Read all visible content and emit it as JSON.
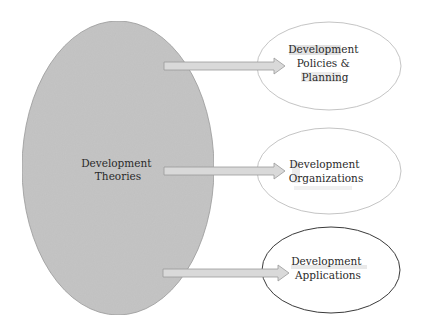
{
  "diagram": {
    "source": {
      "lines": [
        "Development",
        "Theories"
      ],
      "fill": "#c4c4c4",
      "stroke": "#9a9a9a"
    },
    "targets": [
      {
        "lines": [
          "Development",
          "Policies &",
          "Planning"
        ],
        "stroke": "#b5b5b5"
      },
      {
        "lines": [
          "Development",
          "Organizations"
        ],
        "stroke": "#b5b5b5"
      },
      {
        "lines": [
          "Development",
          "Applications"
        ],
        "stroke": "#3a3a3a"
      }
    ],
    "arrow_fill": "#d9d9d9",
    "arrow_stroke": "#9a9a9a"
  }
}
